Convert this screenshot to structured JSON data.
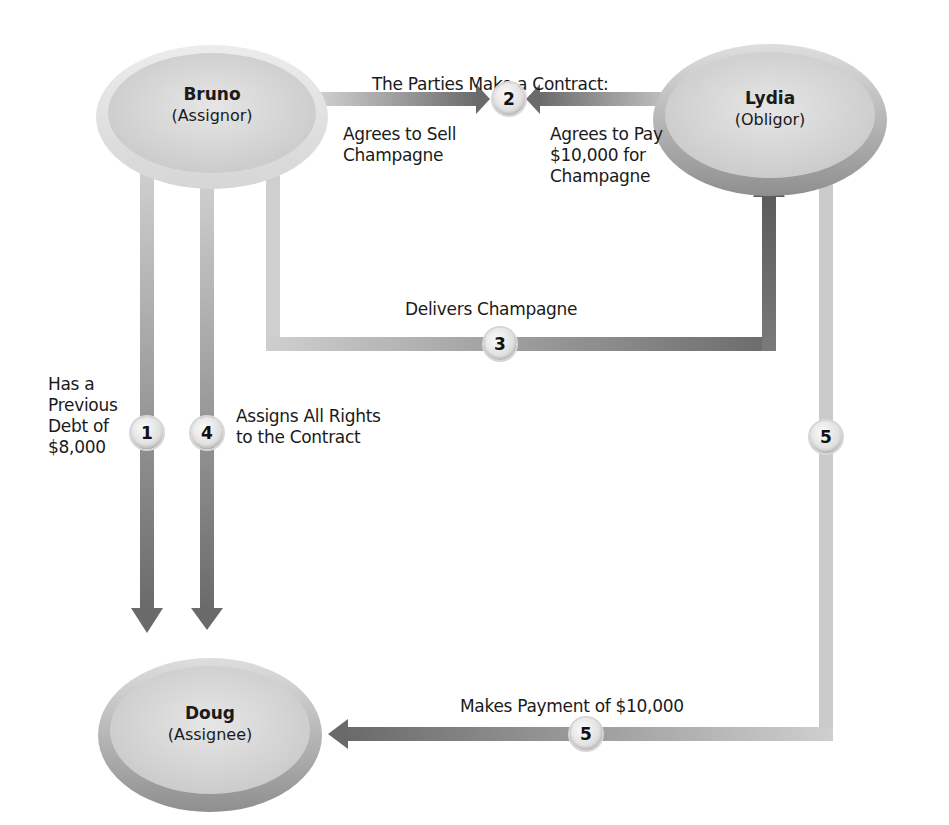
{
  "title": "The Parties Make a Contract:",
  "nodes": {
    "bruno": {
      "name": "Bruno",
      "role": "(Assignor)"
    },
    "lydia": {
      "name": "Lydia",
      "role": "(Obligor)"
    },
    "doug": {
      "name": "Doug",
      "role": "(Assignee)"
    }
  },
  "steps": {
    "s1": {
      "number": "1",
      "label_lines": [
        "Has a",
        "Previous",
        "Debt of",
        "$8,000"
      ]
    },
    "s2": {
      "number": "2",
      "left_lines": [
        "Agrees to Sell",
        "Champagne"
      ],
      "right_lines": [
        "Agrees to Pay",
        "$10,000 for",
        "Champagne"
      ]
    },
    "s3": {
      "number": "3",
      "label": "Delivers Champagne"
    },
    "s4": {
      "number": "4",
      "label_lines": [
        "Assigns All Rights",
        "to the Contract"
      ]
    },
    "s5a": {
      "number": "5"
    },
    "s5b": {
      "number": "5",
      "label": "Makes Payment of $10,000"
    }
  },
  "colors": {
    "line_light": "#c8c8c8",
    "line_dark": "#6e6e6e",
    "node_fill": "#d9d9d9",
    "node_rim": "#b3b3b3"
  }
}
